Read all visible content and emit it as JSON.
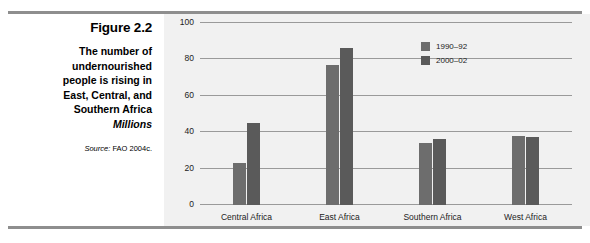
{
  "caption": {
    "figure_number": "Figure 2.2",
    "title_lines": [
      "The number of",
      "undernourished",
      "people is rising in",
      "East, Central, and",
      "Southern Africa"
    ],
    "subtitle": "Millions",
    "source_label": "Source:",
    "source_text": "FAO 2004c."
  },
  "chart_data": {
    "type": "bar",
    "title": "The number of undernourished people is rising in East, Central, and Southern Africa",
    "subtitle": "Millions",
    "categories": [
      "Central Africa",
      "East Africa",
      "Southern Africa",
      "West Africa"
    ],
    "series": [
      {
        "name": "1990–92",
        "color": "#6d6d6d",
        "values": [
          23,
          77,
          34,
          38
        ]
      },
      {
        "name": "2000–02",
        "color": "#5a5a5a",
        "values": [
          45,
          86,
          36,
          37.5
        ]
      }
    ],
    "xlabel": "",
    "ylabel": "",
    "ylim": [
      0,
      100
    ],
    "yticks": [
      0,
      20,
      40,
      60,
      80,
      100
    ],
    "grid": true,
    "legend_position": "top-right",
    "source": "Source: FAO 2004c."
  },
  "colors": {
    "panel_background": "#f1f1f1",
    "rule": "#8e8e8e",
    "gridline": "#9a9a9a",
    "series_1990_92": "#6d6d6d",
    "series_2000_02": "#5a5a5a"
  }
}
